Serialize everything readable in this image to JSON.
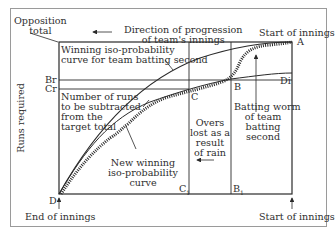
{
  "diagram": {
    "y_axis_label": "Runs required",
    "labels": {
      "opposition_total": [
        "Opposition",
        "total"
      ],
      "direction": [
        "Direction of progression",
        "of team's innings"
      ],
      "start_of_innings_top": "Start of innings",
      "winning_curve": [
        "Winning iso-probability",
        "curve for team batting second"
      ],
      "br": "Br",
      "cr": "Cr",
      "runs_subtracted": [
        "Number of runs",
        "to be subtracted",
        "from the",
        "target total"
      ],
      "point_a": "A",
      "point_b": "B",
      "point_c": "C",
      "point_d": "D",
      "point_di": "Di",
      "point_b1": "B",
      "point_b1_sub": "1",
      "point_c1": "C",
      "point_c1_sub": "1",
      "batting_worm": [
        "Batting worm",
        "of team",
        "batting",
        "second"
      ],
      "overs_lost": [
        "Overs",
        "lost as a",
        "result",
        "of rain"
      ],
      "new_winning_curve": [
        "New winning",
        "iso-probability",
        "curve"
      ],
      "end_of_innings": "End of innings",
      "start_of_innings_bottom": "Start of innings"
    },
    "colors": {
      "line": "#2a2a2a",
      "frame": "#9a9a9a",
      "worm": "#2a2a2a"
    }
  }
}
